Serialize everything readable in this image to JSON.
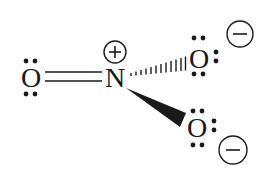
{
  "diagram": {
    "type": "lewis-structure",
    "molecule": "nitrate-resonance-form",
    "atoms": [
      {
        "id": "O1",
        "symbol": "O",
        "charge": "",
        "lone_pairs": 2,
        "x": 31,
        "y": 86
      },
      {
        "id": "N",
        "symbol": "N",
        "charge": "+",
        "lone_pairs": 0,
        "x": 115,
        "y": 86
      },
      {
        "id": "O2",
        "symbol": "O",
        "charge": "−",
        "lone_pairs": 3,
        "x": 199,
        "y": 66
      },
      {
        "id": "O3",
        "symbol": "O",
        "charge": "−",
        "lone_pairs": 3,
        "x": 197,
        "y": 135
      }
    ],
    "bonds": [
      {
        "from": "O1",
        "to": "N",
        "type": "double"
      },
      {
        "from": "N",
        "to": "O2",
        "type": "hashed-wedge"
      },
      {
        "from": "N",
        "to": "O3",
        "type": "solid-wedge"
      }
    ],
    "charges": {
      "N": "+",
      "O2": "−",
      "O3": "−"
    },
    "colors": {
      "ink": "#1a1a1a",
      "background": "#ffffff"
    }
  }
}
